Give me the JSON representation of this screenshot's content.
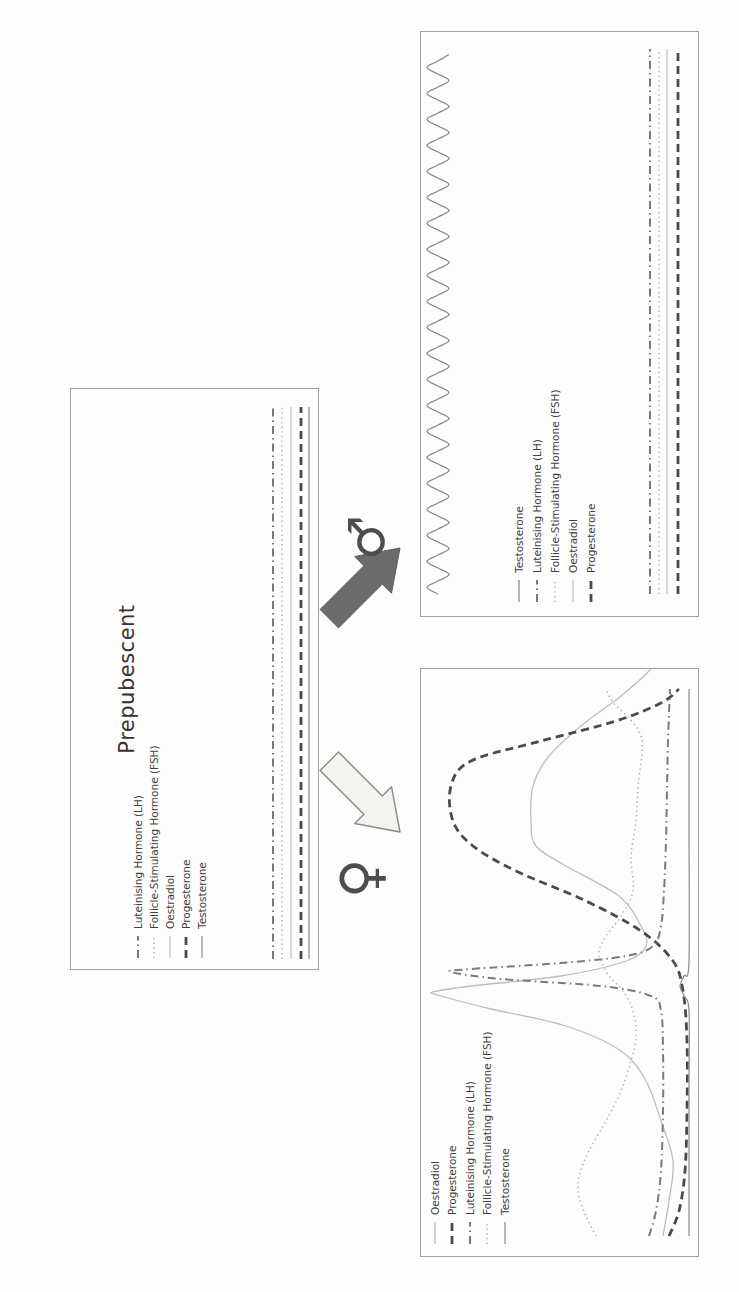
{
  "page": {
    "background": "#fdfdfc",
    "kind": "scanned figure, rotated 90deg"
  },
  "figure": {
    "title": "Prepubescent",
    "symbols": {
      "female": "♀",
      "male": "♂"
    },
    "arrows": {
      "female": {
        "fill": "#f4f3ee",
        "stroke": "#8a8a8a",
        "points": "521.5,320.1 539.9,338.5 496.1,382.3 505.3,391.5 460,400 468.5,354.7 477.7,363.9"
      },
      "male": {
        "fill": "#6b6b6b",
        "stroke": "#5d5d5d",
        "points": "664.1,338.5 682.5,320.1 726.3,363.9 735.5,354.7 744,400 698.7,391.5 707.9,382.3"
      }
    }
  },
  "chart_data": [
    {
      "name": "prepubescent",
      "type": "line",
      "title": "Prepubescent",
      "box": {
        "w": 580,
        "h": 247
      },
      "note": "all five hormones flat near zero before puberty",
      "legend_order": [
        "lh",
        "fsh",
        "oestradiol",
        "progesterone",
        "testosterone"
      ],
      "series": {
        "lh": {
          "label": "Luteinising Hormone (LH)",
          "stroke": "#7a7a7a",
          "width": 2,
          "dash": "8 4 1.5 4",
          "points": [
            [
              10,
              202
            ],
            [
              562,
              202
            ]
          ]
        },
        "fsh": {
          "label": "Follicle-Stimulating Hormone (FSH)",
          "stroke": "#b2b2b2",
          "width": 1.5,
          "dash": "1.3 3.4",
          "points": [
            [
              10,
              211
            ],
            [
              562,
              211
            ]
          ]
        },
        "oestradiol": {
          "label": "Oestradiol",
          "stroke": "#c0c0c0",
          "width": 1.2,
          "dash": "",
          "points": [
            [
              10,
              220
            ],
            [
              562,
              220
            ]
          ]
        },
        "progesterone": {
          "label": "Progesterone",
          "stroke": "#4a4a4a",
          "width": 2.8,
          "dash": "8 5",
          "points": [
            [
              10,
              230
            ],
            [
              562,
              230
            ]
          ]
        },
        "testosterone": {
          "label": "Testosterone",
          "stroke": "#8c8c8c",
          "width": 1.2,
          "dash": "",
          "points": [
            [
              10,
              238
            ],
            [
              562,
              238
            ]
          ]
        }
      }
    },
    {
      "name": "female",
      "type": "line",
      "title": "",
      "box": {
        "w": 587,
        "h": 277
      },
      "note": "menstrual cycle: oestradiol peak then LH surge mid-cycle, progesterone luteal peak",
      "legend_order": [
        "oestradiol",
        "progesterone",
        "lh",
        "fsh",
        "testosterone"
      ],
      "series": {
        "oestradiol": {
          "label": "Oestradiol",
          "stroke": "#bdbdbd",
          "width": 1.3,
          "dash": "",
          "points": [
            [
              20,
              242
            ],
            [
              55,
              248
            ],
            [
              95,
              252
            ],
            [
              135,
              240
            ],
            [
              175,
              225
            ],
            [
              205,
              200
            ],
            [
              230,
              145
            ],
            [
              247,
              70
            ],
            [
              260,
              20
            ],
            [
              264,
              12
            ],
            [
              270,
              50
            ],
            [
              280,
              140
            ],
            [
              295,
              205
            ],
            [
              310,
              225
            ],
            [
              330,
              220
            ],
            [
              360,
              198
            ],
            [
              390,
              145
            ],
            [
              410,
              115
            ],
            [
              435,
              110
            ],
            [
              470,
              112
            ],
            [
              500,
              128
            ],
            [
              530,
              160
            ],
            [
              560,
              200
            ],
            [
              585,
              228
            ],
            [
              602,
              240
            ]
          ]
        },
        "progesterone": {
          "label": "Progesterone",
          "stroke": "#4a4a4a",
          "width": 2.8,
          "dash": "8 5",
          "points": [
            [
              20,
              248
            ],
            [
              45,
              258
            ],
            [
              85,
              264
            ],
            [
              145,
              266
            ],
            [
              215,
              266
            ],
            [
              265,
              262
            ],
            [
              295,
              252
            ],
            [
              325,
              220
            ],
            [
              355,
              165
            ],
            [
              385,
              95
            ],
            [
              410,
              52
            ],
            [
              435,
              32
            ],
            [
              470,
              30
            ],
            [
              495,
              50
            ],
            [
              515,
              120
            ],
            [
              535,
              195
            ],
            [
              553,
              240
            ],
            [
              567,
              258
            ]
          ]
        },
        "lh": {
          "label": "Luteinising Hormone (LH)",
          "stroke": "#7a7a7a",
          "width": 2,
          "dash": "8 4 1.5 4",
          "points": [
            [
              20,
              228
            ],
            [
              45,
              235
            ],
            [
              85,
              240
            ],
            [
              145,
              242
            ],
            [
              205,
              242
            ],
            [
              245,
              240
            ],
            [
              260,
              230
            ],
            [
              270,
              180
            ],
            [
              277,
              80
            ],
            [
              284,
              30
            ],
            [
              287,
              50
            ],
            [
              293,
              140
            ],
            [
              300,
              205
            ],
            [
              310,
              232
            ],
            [
              330,
              240
            ],
            [
              365,
              243
            ],
            [
              415,
              245
            ],
            [
              465,
              246
            ],
            [
              515,
              247
            ],
            [
              567,
              249
            ]
          ]
        },
        "fsh": {
          "label": "Follicle-Stimulating Hormone (FSH)",
          "stroke": "#adadad",
          "width": 1.5,
          "dash": "1.3 3.4",
          "points": [
            [
              20,
              175
            ],
            [
              40,
              165
            ],
            [
              60,
              158
            ],
            [
              80,
              158
            ],
            [
              105,
              168
            ],
            [
              135,
              185
            ],
            [
              165,
              200
            ],
            [
              195,
              210
            ],
            [
              220,
              215
            ],
            [
              245,
              212
            ],
            [
              265,
              202
            ],
            [
              280,
              188
            ],
            [
              295,
              180
            ],
            [
              305,
              178
            ],
            [
              320,
              185
            ],
            [
              340,
              200
            ],
            [
              365,
              212
            ],
            [
              400,
              210
            ],
            [
              435,
              215
            ],
            [
              470,
              217
            ],
            [
              520,
              220
            ],
            [
              554,
              192
            ],
            [
              567,
              185
            ]
          ]
        },
        "testosterone": {
          "label": "Testosterone",
          "stroke": "#8c8c8c",
          "width": 1.2,
          "dash": "",
          "points": [
            [
              20,
              268
            ],
            [
              165,
              268
            ],
            [
              245,
              268
            ],
            [
              260,
              263
            ],
            [
              270,
              259
            ],
            [
              280,
              263
            ],
            [
              295,
              268
            ],
            [
              430,
              268
            ],
            [
              567,
              268
            ]
          ]
        }
      }
    },
    {
      "name": "male",
      "type": "line",
      "title": "",
      "box": {
        "w": 584,
        "h": 277
      },
      "note": "testosterone oscillates high; other hormones flat near zero",
      "legend_order": [
        "testosterone",
        "lh",
        "fsh",
        "oestradiol",
        "progesterone"
      ],
      "series": {
        "testosterone": {
          "label": "Testosterone",
          "stroke": "#8c8c8c",
          "width": 1.3,
          "dash": "",
          "zigzag": {
            "x0": 22,
            "x1": 567,
            "cy": 17,
            "amp": 11,
            "period": 26
          }
        },
        "lh": {
          "label": "Luteinising Hormone (LH)",
          "stroke": "#7a7a7a",
          "width": 2,
          "dash": "8 4 1.5 4",
          "points": [
            [
              22,
              229
            ],
            [
              567,
              229
            ]
          ]
        },
        "fsh": {
          "label": "Follicle-Stimulating Hormone (FSH)",
          "stroke": "#b2b2b2",
          "width": 1.5,
          "dash": "1.3 3.4",
          "points": [
            [
              22,
              238
            ],
            [
              567,
              238
            ]
          ]
        },
        "oestradiol": {
          "label": "Oestradiol",
          "stroke": "#c0c0c0",
          "width": 1.2,
          "dash": "",
          "points": [
            [
              22,
              246
            ],
            [
              567,
              246
            ]
          ]
        },
        "progesterone": {
          "label": "Progesterone",
          "stroke": "#4a4a4a",
          "width": 2.8,
          "dash": "8 5",
          "points": [
            [
              22,
              257
            ],
            [
              567,
              257
            ]
          ]
        }
      }
    }
  ]
}
